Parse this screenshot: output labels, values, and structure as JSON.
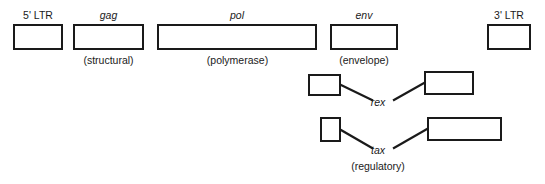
{
  "diagram": {
    "title_text": "",
    "stroke_color": "#1a1a1a",
    "fill_color": "#ffffff",
    "genome_row": [
      {
        "id": "five-prime-ltr",
        "label": "5' LTR",
        "label_style": "upright",
        "sublabel": "",
        "x": 13,
        "y": 24,
        "w": 50,
        "h": 26,
        "label_x": 13,
        "label_y": 9,
        "label_w": 50,
        "sublabel_x": 0,
        "sublabel_y": 0,
        "sublabel_w": 0
      },
      {
        "id": "gag",
        "label": "gag",
        "label_style": "italic",
        "sublabel": "(structural)",
        "x": 73,
        "y": 24,
        "w": 71,
        "h": 26,
        "label_x": 73,
        "label_y": 9,
        "label_w": 71,
        "sublabel_x": 58,
        "sublabel_y": 54,
        "sublabel_w": 101
      },
      {
        "id": "pol",
        "label": "pol",
        "label_style": "italic",
        "sublabel": "(polymerase)",
        "x": 157,
        "y": 24,
        "w": 160,
        "h": 26,
        "label_x": 157,
        "label_y": 9,
        "label_w": 160,
        "sublabel_x": 180,
        "sublabel_y": 54,
        "sublabel_w": 115
      },
      {
        "id": "env",
        "label": "env",
        "label_style": "italic",
        "sublabel": "(envelope)",
        "x": 330,
        "y": 24,
        "w": 68,
        "h": 26,
        "label_x": 330,
        "label_y": 9,
        "label_w": 68,
        "sublabel_x": 318,
        "sublabel_y": 54,
        "sublabel_w": 92
      },
      {
        "id": "three-prime-ltr",
        "label": "3' LTR",
        "label_style": "upright",
        "sublabel": "",
        "x": 487,
        "y": 24,
        "w": 44,
        "h": 26,
        "label_x": 484,
        "label_y": 9,
        "label_w": 50,
        "sublabel_x": 0,
        "sublabel_y": 0,
        "sublabel_w": 0
      }
    ],
    "spliced_rows": [
      {
        "id": "rex",
        "label": "rex",
        "label_style": "italic",
        "sublabel": "",
        "label_x": 358,
        "label_y": 96,
        "label_w": 40,
        "sublabel_x": 0,
        "sublabel_y": 0,
        "sublabel_w": 0,
        "exons": [
          {
            "id": "rex-exon-1",
            "x": 308,
            "y": 74,
            "w": 33,
            "h": 22
          },
          {
            "id": "rex-exon-2",
            "x": 424,
            "y": 71,
            "w": 50,
            "h": 24
          }
        ],
        "connectors": [
          {
            "x1": 341,
            "y1": 85,
            "x2": 372,
            "y2": 100
          },
          {
            "x1": 424,
            "y1": 83,
            "x2": 394,
            "y2": 100
          }
        ]
      },
      {
        "id": "tax",
        "label": "tax",
        "label_style": "italic",
        "sublabel": "(regulatory)",
        "label_x": 358,
        "label_y": 144,
        "label_w": 40,
        "sublabel_x": 330,
        "sublabel_y": 160,
        "sublabel_w": 96,
        "exons": [
          {
            "id": "tax-exon-1",
            "x": 320,
            "y": 117,
            "w": 21,
            "h": 25
          },
          {
            "id": "tax-exon-2",
            "x": 427,
            "y": 117,
            "w": 75,
            "h": 24
          }
        ],
        "connectors": [
          {
            "x1": 341,
            "y1": 130,
            "x2": 372,
            "y2": 148
          },
          {
            "x1": 427,
            "y1": 129,
            "x2": 394,
            "y2": 148
          }
        ]
      }
    ]
  }
}
